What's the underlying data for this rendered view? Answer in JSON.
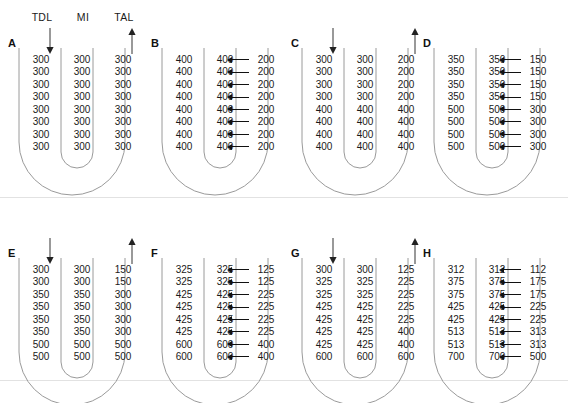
{
  "figure": {
    "column_headers": [
      "TDL",
      "MI",
      "TAL"
    ],
    "flow_arrow_down_name": "down-arrow",
    "flow_arrow_up_name": "up-arrow",
    "baseline_color": "#e2e2e2",
    "tube_color": "#9a9a9a",
    "text_color": "#1a1a1a"
  },
  "chart_data": {
    "type": "table",
    "columns": [
      "TDL",
      "MI",
      "TAL"
    ],
    "units": "mOsm/L",
    "panels": [
      {
        "letter": "A",
        "has_flow_arrows": true,
        "has_transport_arrows": false,
        "rows": [
          [
            "300",
            "300",
            "300"
          ],
          [
            "300",
            "300",
            "300"
          ],
          [
            "300",
            "300",
            "300"
          ],
          [
            "300",
            "300",
            "300"
          ],
          [
            "300",
            "300",
            "300"
          ],
          [
            "300",
            "300",
            "300"
          ],
          [
            "300",
            "300",
            "300"
          ],
          [
            "300",
            "300",
            "300"
          ]
        ]
      },
      {
        "letter": "B",
        "has_flow_arrows": false,
        "has_transport_arrows": true,
        "rows": [
          [
            "400",
            "400",
            "200"
          ],
          [
            "400",
            "400",
            "200"
          ],
          [
            "400",
            "400",
            "200"
          ],
          [
            "400",
            "400",
            "200"
          ],
          [
            "400",
            "400",
            "200"
          ],
          [
            "400",
            "400",
            "200"
          ],
          [
            "400",
            "400",
            "200"
          ],
          [
            "400",
            "400",
            "200"
          ]
        ]
      },
      {
        "letter": "C",
        "has_flow_arrows": true,
        "has_transport_arrows": false,
        "rows": [
          [
            "300",
            "300",
            "200"
          ],
          [
            "300",
            "300",
            "200"
          ],
          [
            "300",
            "300",
            "200"
          ],
          [
            "300",
            "300",
            "200"
          ],
          [
            "400",
            "400",
            "400"
          ],
          [
            "400",
            "400",
            "400"
          ],
          [
            "400",
            "400",
            "400"
          ],
          [
            "400",
            "400",
            "400"
          ]
        ]
      },
      {
        "letter": "D",
        "has_flow_arrows": false,
        "has_transport_arrows": true,
        "rows": [
          [
            "350",
            "350",
            "150"
          ],
          [
            "350",
            "350",
            "150"
          ],
          [
            "350",
            "350",
            "150"
          ],
          [
            "350",
            "350",
            "150"
          ],
          [
            "500",
            "500",
            "300"
          ],
          [
            "500",
            "500",
            "300"
          ],
          [
            "500",
            "500",
            "300"
          ],
          [
            "500",
            "500",
            "300"
          ]
        ]
      },
      {
        "letter": "E",
        "has_flow_arrows": true,
        "has_transport_arrows": false,
        "rows": [
          [
            "300",
            "300",
            "150"
          ],
          [
            "300",
            "300",
            "150"
          ],
          [
            "350",
            "350",
            "300"
          ],
          [
            "350",
            "350",
            "300"
          ],
          [
            "350",
            "350",
            "300"
          ],
          [
            "350",
            "350",
            "300"
          ],
          [
            "500",
            "500",
            "500"
          ],
          [
            "500",
            "500",
            "500"
          ]
        ]
      },
      {
        "letter": "F",
        "has_flow_arrows": false,
        "has_transport_arrows": true,
        "rows": [
          [
            "325",
            "325",
            "125"
          ],
          [
            "325",
            "325",
            "125"
          ],
          [
            "425",
            "425",
            "225"
          ],
          [
            "425",
            "425",
            "225"
          ],
          [
            "425",
            "425",
            "225"
          ],
          [
            "425",
            "425",
            "225"
          ],
          [
            "600",
            "600",
            "400"
          ],
          [
            "600",
            "600",
            "400"
          ]
        ]
      },
      {
        "letter": "G",
        "has_flow_arrows": true,
        "has_transport_arrows": false,
        "rows": [
          [
            "300",
            "300",
            "125"
          ],
          [
            "325",
            "325",
            "225"
          ],
          [
            "325",
            "325",
            "225"
          ],
          [
            "425",
            "425",
            "225"
          ],
          [
            "425",
            "425",
            "225"
          ],
          [
            "425",
            "425",
            "400"
          ],
          [
            "425",
            "425",
            "400"
          ],
          [
            "600",
            "600",
            "600"
          ]
        ]
      },
      {
        "letter": "H",
        "has_flow_arrows": false,
        "has_transport_arrows": true,
        "rows": [
          [
            "312",
            "312",
            "112"
          ],
          [
            "375",
            "375",
            "175"
          ],
          [
            "375",
            "375",
            "175"
          ],
          [
            "425",
            "425",
            "225"
          ],
          [
            "425",
            "425",
            "225"
          ],
          [
            "513",
            "513",
            "313"
          ],
          [
            "513",
            "513",
            "313"
          ],
          [
            "700",
            "700",
            "500"
          ]
        ]
      }
    ]
  }
}
